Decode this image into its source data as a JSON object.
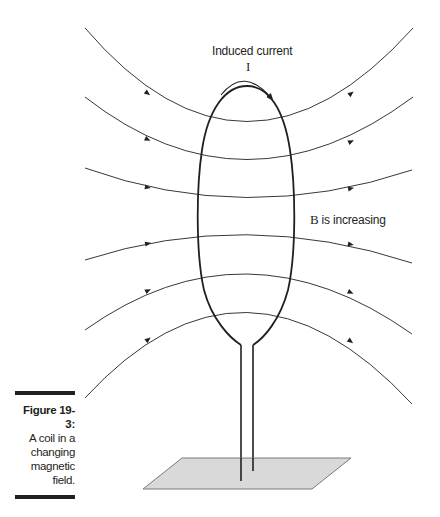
{
  "figure": {
    "label": "Figure 19-3:",
    "caption_lines": [
      "A coil in a",
      "changing",
      "magnetic",
      "field."
    ],
    "annotations": {
      "induced_current": "Induced current",
      "current_symbol": "I",
      "b_symbol": "B",
      "b_state": " is increasing"
    },
    "colors": {
      "line": "#231f20",
      "plate_fill": "#d9d9d9",
      "plate_stroke": "#7a7a7a",
      "caption_bar": "#231f20"
    },
    "elements": {
      "field_lines_count": 6,
      "field_direction": "left-to-right",
      "coil": "vertical elliptical loop with two leads",
      "base": "gray parallelogram plate"
    }
  }
}
